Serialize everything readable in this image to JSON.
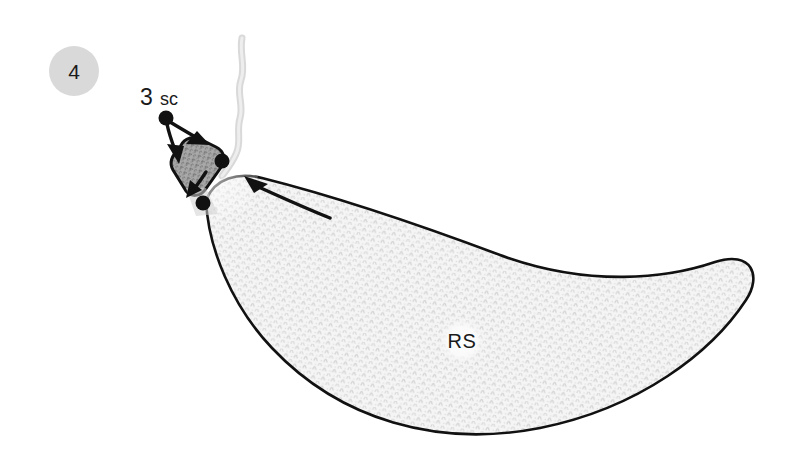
{
  "canvas": {
    "width": 802,
    "height": 450,
    "background": "#ffffff"
  },
  "step_badge": {
    "label": "4",
    "fill": "#d9d9d9",
    "text_color": "#1a1a1a",
    "center_x": 74,
    "center_y": 71,
    "radius": 25
  },
  "annotations": {
    "stitch_count": "3",
    "stitch_type": "sc",
    "stitch_label_full": "3 sc",
    "side_marker": "RS"
  },
  "colors": {
    "outline": "#111111",
    "fabric_fill": "#f4f4f4",
    "fabric_texture": "#d2d2d2",
    "swatch_fill": "#a8a8a8",
    "swatch_texture": "#6e6e6e",
    "yarn_tail": "#d8d8d8",
    "badge_gray": "#d9d9d9",
    "marker_dot": "#111111",
    "rs_halo": "#fbfbfb"
  },
  "markers": {
    "dots": [
      {
        "name": "start-dot-upper-left",
        "x": 166,
        "y": 118,
        "r": 7
      },
      {
        "name": "dot-swatch-right",
        "x": 222,
        "y": 161,
        "r": 7
      },
      {
        "name": "dot-crescent-tip",
        "x": 203,
        "y": 203,
        "r": 7
      }
    ]
  },
  "shapes": {
    "crescent_name": "crescent-fabric-body",
    "swatch_name": "stitch-swatch-block",
    "yarn_name": "yarn-tail-strand"
  }
}
